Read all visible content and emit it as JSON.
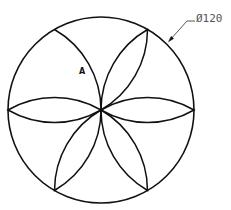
{
  "drawing": {
    "title": "Six-petal rosette inside circle",
    "dimension": {
      "label": "Ø120",
      "type": "diameter"
    },
    "region_label": "A",
    "geometry": {
      "center": [
        101,
        110
      ],
      "radius": 93,
      "petal_count": 6
    },
    "colors": {
      "line": "#111111",
      "dimension_text": "#555555",
      "background": "#ffffff"
    }
  }
}
